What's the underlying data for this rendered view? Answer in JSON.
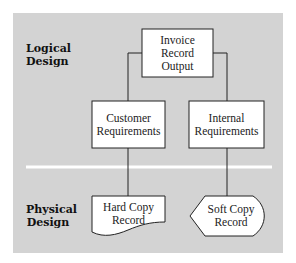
{
  "sections": {
    "logical": {
      "line1": "Logical",
      "line2": "Design"
    },
    "physical": {
      "line1": "Physical",
      "line2": "Design"
    }
  },
  "nodes": {
    "invoice": {
      "line1": "Invoice",
      "line2": "Record",
      "line3": "Output"
    },
    "customer": {
      "line1": "Customer",
      "line2": "Requirements"
    },
    "internal": {
      "line1": "Internal",
      "line2": "Requirements"
    },
    "hardcopy": {
      "line1": "Hard Copy",
      "line2": "Record"
    },
    "softcopy": {
      "line1": "Soft Copy",
      "line2": "Record"
    }
  },
  "colors": {
    "panel": "#d3d3d3",
    "box": "#ffffff",
    "stroke": "#222222",
    "divider": "#ffffff"
  }
}
